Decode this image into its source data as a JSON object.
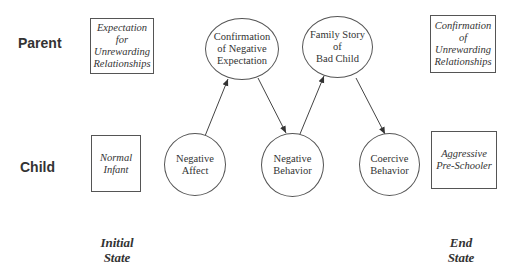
{
  "rows": {
    "parent": "Parent",
    "child": "Child"
  },
  "boxes": {
    "parent_initial": "Expectation\nfor\nUnrewarding\nRelationships",
    "parent_end": "Confirmation\nof\nUnrewarding\nRelationships",
    "child_initial": "Normal\nInfant",
    "child_end": "Aggressive\nPre-Schooler"
  },
  "nodes": {
    "negative_affect": "Negative\nAffect",
    "confirmation": "Confirmation\nof Negative\nExpectation",
    "negative_behavior": "Negative\nBehavior",
    "family_story": "Family Story\nof\nBad Child",
    "coercive_behavior": "Coercive\nBehavior"
  },
  "states": {
    "initial": "Initial\nState",
    "end": "End\nState"
  },
  "edges": [
    {
      "from": "negative_affect",
      "to": "confirmation"
    },
    {
      "from": "confirmation",
      "to": "negative_behavior"
    },
    {
      "from": "negative_behavior",
      "to": "family_story"
    },
    {
      "from": "family_story",
      "to": "coercive_behavior"
    }
  ]
}
